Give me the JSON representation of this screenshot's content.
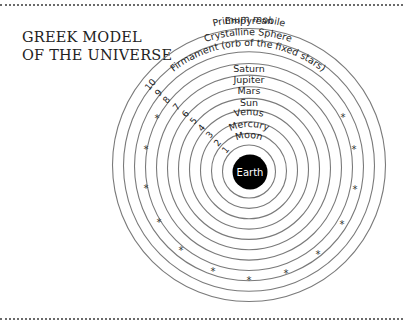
{
  "title": {
    "line1": "GREEK MODEL",
    "line2": "OF THE UNIVERSE"
  },
  "center": {
    "label": "Earth",
    "color": "#000000"
  },
  "spheres": [
    {
      "number": "1",
      "label": "Moon"
    },
    {
      "number": "2",
      "label": "Mercury"
    },
    {
      "number": "3",
      "label": "Venus"
    },
    {
      "number": "4",
      "label": "Sun"
    },
    {
      "number": "5",
      "label": "Mars"
    },
    {
      "number": "6",
      "label": "Jupiter"
    },
    {
      "number": "7",
      "label": "Saturn"
    },
    {
      "number": "8",
      "label": "Firmament (orb of the fixed stars)"
    },
    {
      "number": "9",
      "label": "Crystalline Sphere"
    },
    {
      "number": "10",
      "label": "Primum mobile"
    }
  ],
  "outer_label": "Empyrean",
  "star_symbol": "*",
  "colors": {
    "ring": "#7a7a7a",
    "text": "#1e1e1e",
    "dotted_rule": "#6a6a6a"
  }
}
